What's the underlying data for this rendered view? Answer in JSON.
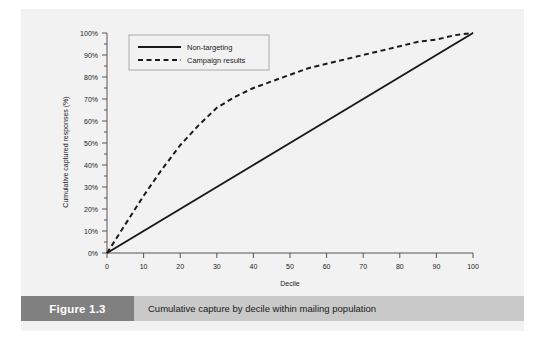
{
  "figure": {
    "number_label": "Figure 1.3",
    "caption": "Cumulative capture by decile within mailing population"
  },
  "colors": {
    "card_background": "#f2f2f2",
    "caption_bar": "#c9c9c9",
    "figure_block": "#808080",
    "line": "#1a1a1a",
    "axis": "#555555",
    "legend_border": "#9a9a9a"
  },
  "chart_data": {
    "type": "line",
    "title": "",
    "xlabel": "Decile",
    "ylabel": "Cumulative captured responses (%)",
    "xlim": [
      0,
      100
    ],
    "ylim": [
      0,
      100
    ],
    "grid": false,
    "legend_position": "top-left",
    "x_tick_labels": [
      "0",
      "10",
      "20",
      "30",
      "40",
      "50",
      "60",
      "70",
      "80",
      "90",
      "100"
    ],
    "x_ticks": [
      0,
      10,
      20,
      30,
      40,
      50,
      60,
      70,
      80,
      90,
      100
    ],
    "y_tick_labels": [
      "0%",
      "10%",
      "20%",
      "30%",
      "40%",
      "50%",
      "60%",
      "70%",
      "80%",
      "90%",
      "100%"
    ],
    "y_ticks": [
      0,
      10,
      20,
      30,
      40,
      50,
      60,
      70,
      80,
      90,
      100
    ],
    "x": [
      0,
      5,
      10,
      15,
      20,
      25,
      30,
      35,
      40,
      45,
      50,
      55,
      60,
      65,
      70,
      75,
      80,
      85,
      90,
      95,
      100
    ],
    "series": [
      {
        "name": "Non-targeting",
        "style": "solid",
        "values": [
          0,
          5,
          10,
          15,
          20,
          25,
          30,
          35,
          40,
          45,
          50,
          55,
          60,
          65,
          70,
          75,
          80,
          85,
          90,
          95,
          100
        ]
      },
      {
        "name": "Campaign results",
        "style": "dashed",
        "values": [
          0,
          13,
          26,
          38,
          49,
          58,
          66,
          71,
          75,
          78,
          81,
          84,
          86,
          88,
          90,
          92,
          94,
          96,
          97,
          99,
          100
        ]
      }
    ]
  },
  "legend": {
    "items": [
      {
        "label": "Non-targeting",
        "style": "solid"
      },
      {
        "label": "Campaign results",
        "style": "dashed"
      }
    ]
  }
}
